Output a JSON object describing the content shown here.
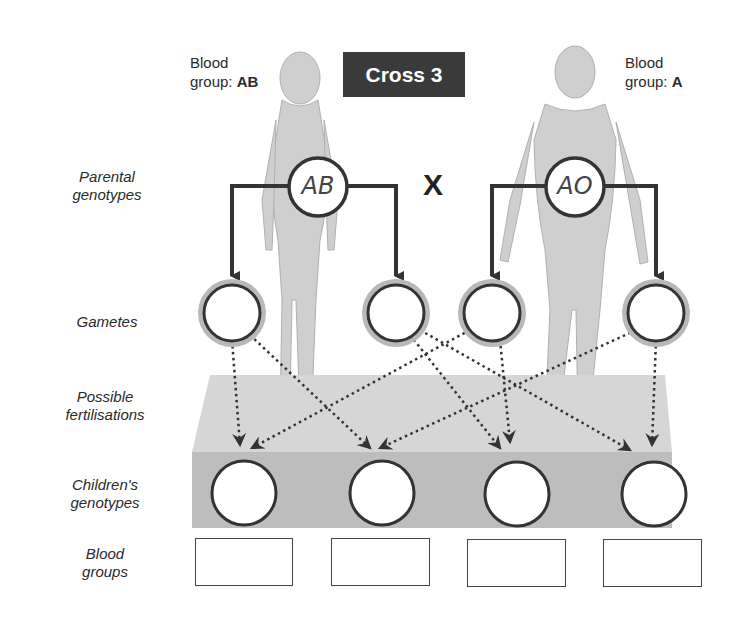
{
  "title": "Cross 3",
  "cross_symbol": "X",
  "mother": {
    "label_line1": "Blood",
    "label_prefix": "group: ",
    "blood_group": "AB",
    "genotype": "AB"
  },
  "father": {
    "label_line1": "Blood",
    "label_prefix": "group: ",
    "blood_group": "A",
    "genotype": "AO"
  },
  "row_labels": {
    "parental": [
      "Parental",
      "genotypes"
    ],
    "gametes": "Gametes",
    "fertilisations": [
      "Possible",
      "fertilisations"
    ],
    "children": [
      "Children's",
      "genotypes"
    ],
    "blood_groups": [
      "Blood",
      "groups"
    ]
  },
  "gametes": [
    "",
    "",
    "",
    ""
  ],
  "children_genotypes": [
    "",
    "",
    "",
    ""
  ],
  "children_blood_groups": [
    "",
    "",
    "",
    ""
  ],
  "colors": {
    "title_bg": "#3a3a3a",
    "platform_top": "#d6d6d6",
    "platform_front": "#bdbdbd",
    "gamete_halo": "#b8b8b8",
    "line": "#333333"
  }
}
